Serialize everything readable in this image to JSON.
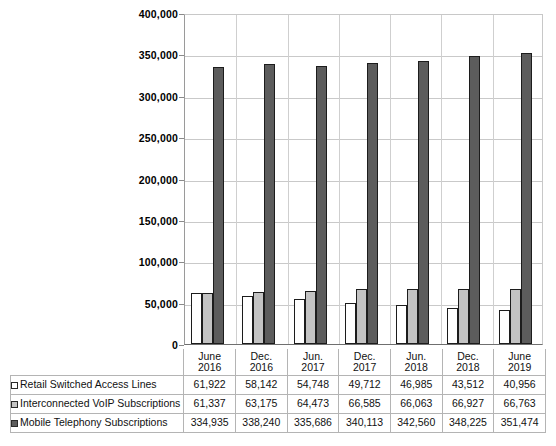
{
  "chart_data": {
    "type": "bar",
    "title": "",
    "xlabel": "",
    "ylabel": "",
    "ylim": [
      0,
      400000
    ],
    "ytick_step": 50000,
    "yticks": [
      "0",
      "50,000",
      "100,000",
      "150,000",
      "200,000",
      "250,000",
      "300,000",
      "350,000",
      "400,000"
    ],
    "grid": true,
    "legend_position": "table-row-labels",
    "categories": [
      "June 2016",
      "Dec. 2016",
      "Jun. 2017",
      "Dec. 2017",
      "Jun. 2018",
      "Dec. 2018",
      "June 2019"
    ],
    "category_lines": [
      [
        "June",
        "2016"
      ],
      [
        "Dec.",
        "2016"
      ],
      [
        "Jun.",
        "2017"
      ],
      [
        "Dec.",
        "2017"
      ],
      [
        "Jun.",
        "2018"
      ],
      [
        "Dec.",
        "2018"
      ],
      [
        "June",
        "2019"
      ]
    ],
    "series": [
      {
        "name": "Retail Switched Access Lines",
        "color": "#ffffff",
        "values": [
          61922,
          58142,
          54748,
          49712,
          46985,
          43512,
          40956
        ],
        "labels": [
          "61,922",
          "58,142",
          "54,748",
          "49,712",
          "46,985",
          "43,512",
          "40,956"
        ]
      },
      {
        "name": "Interconnected VoIP Subscriptions",
        "color": "#c3c3c3",
        "values": [
          61337,
          63175,
          64473,
          66585,
          66063,
          66927,
          66763
        ],
        "labels": [
          "61,337",
          "63,175",
          "64,473",
          "66,585",
          "66,063",
          "66,927",
          "66,763"
        ]
      },
      {
        "name": "Mobile Telephony Subscriptions",
        "color": "#5c5c5c",
        "values": [
          334935,
          338240,
          335686,
          340113,
          342560,
          348225,
          351474
        ],
        "labels": [
          "334,935",
          "338,240",
          "335,686",
          "340,113",
          "342,560",
          "348,225",
          "351,474"
        ]
      }
    ]
  }
}
